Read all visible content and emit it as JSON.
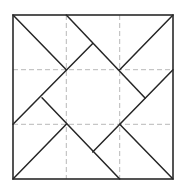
{
  "diagram": {
    "title": "",
    "colors": {
      "background": "#ffffff",
      "outline": "#2a2a2a",
      "solid_line": "#262626",
      "grid_dash": "#b8b8b8"
    },
    "square": {
      "x": 13,
      "y": 15,
      "width": 160,
      "height": 164
    },
    "grid": {
      "vertical_x": [
        66.3,
        119.7
      ],
      "horizontal_y": [
        69.7,
        124.3
      ],
      "dash_pattern": "5 3"
    },
    "segments": [
      {
        "id": "tl-corner-diag",
        "x1": 13,
        "y1": 15,
        "x2": 66.3,
        "y2": 69.7
      },
      {
        "id": "top-long-diag",
        "x1": 66.3,
        "y1": 15,
        "x2": 145.3,
        "y2": 98.3
      },
      {
        "id": "top-left-anti-diag",
        "x1": 92.7,
        "y1": 43.5,
        "x2": 13,
        "y2": 124.3
      },
      {
        "id": "tr-corner-diag",
        "x1": 173,
        "y1": 15,
        "x2": 119.7,
        "y2": 69.7
      },
      {
        "id": "right-anti-diag",
        "x1": 173,
        "y1": 69.7,
        "x2": 92.7,
        "y2": 152
      },
      {
        "id": "left-long-diag",
        "x1": 42,
        "y1": 97.7,
        "x2": 119.7,
        "y2": 179
      },
      {
        "id": "bl-corner-diag",
        "x1": 13,
        "y1": 179,
        "x2": 66.3,
        "y2": 124.3
      },
      {
        "id": "br-corner-diag",
        "x1": 119.7,
        "y1": 124.3,
        "x2": 173,
        "y2": 179
      }
    ]
  }
}
